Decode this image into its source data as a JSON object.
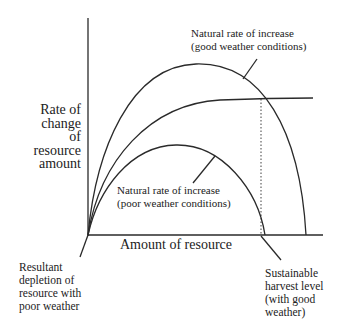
{
  "diagram": {
    "axes": {
      "y_label_lines": [
        "Rate of",
        "change",
        "of",
        "resource",
        "amount"
      ],
      "x_label": "Amount of resource"
    },
    "curves": [
      {
        "name": "natural-rate-good-weather",
        "label_lines": [
          "Natural rate of increase",
          "(good weather conditions)"
        ]
      },
      {
        "name": "harvest-rate",
        "label_lines": []
      },
      {
        "name": "natural-rate-poor-weather",
        "label_lines": [
          "Natural rate of increase",
          "(poor weather conditions)"
        ]
      }
    ],
    "annotations": {
      "depletion": [
        "Resultant",
        "depletion of",
        "resource with",
        "poor weather"
      ],
      "sustainable": [
        "Sustainable",
        "harvest level",
        "(with good",
        "weather)"
      ]
    },
    "colors": {
      "line": "#2a2a2a",
      "text": "#222222",
      "background": "#ffffff"
    }
  }
}
